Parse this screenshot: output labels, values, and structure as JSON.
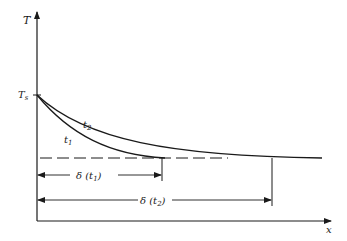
{
  "diagram": {
    "y_axis_label": "T",
    "x_axis_label": "x",
    "surface_temp_label": "T",
    "surface_temp_subscript": "s",
    "curves": [
      {
        "name": "t",
        "subscript": "1"
      },
      {
        "name": "t",
        "subscript": "2"
      }
    ],
    "dimensions": [
      {
        "label_prefix": "δ (t",
        "subscript": "1",
        "label_suffix": ")"
      },
      {
        "label_prefix": "δ (t",
        "subscript": "2",
        "label_suffix": ")"
      }
    ]
  },
  "colors": {
    "ink": "#1a1a1a",
    "background": "#ffffff"
  }
}
